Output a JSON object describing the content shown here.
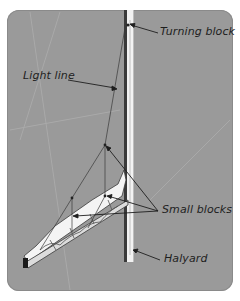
{
  "diagram": {
    "labels": {
      "turning_block": "Turning block",
      "light_line": "Light line",
      "small_blocks": "Small blocks",
      "halyard": "Halyard"
    },
    "colors": {
      "background": "#9a9a9a",
      "mast_dark": "#3a3a3a",
      "mast_light": "#f2f2f2",
      "sail": "#f4f4f4",
      "line": "#2a2a2a"
    }
  }
}
